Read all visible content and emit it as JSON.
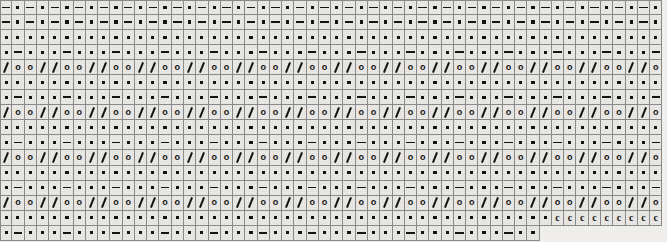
{
  "chart_data": {
    "type": "table",
    "xlabel": "stitch number",
    "ylabel": "row number",
    "grid": true,
    "legend_position": "none",
    "columns": 54,
    "rows": 16,
    "cell_width_px": 12.28,
    "cell_height_px": 15.05,
    "symbol_names": {
      "dash": "purl-stitch-dash",
      "dot": "knit-stitch-dot",
      "slash": "decrease-slash",
      "yo": "yarn-over-circle",
      "c": "cable-stitch-c",
      "blank": "no-stitch-blank"
    },
    "symbol_glyphs": {
      "dash": "—",
      "dot": "•",
      "slash": "/",
      "yo": "o",
      "c": "c",
      "blank": ""
    },
    "colors": {
      "cell_fill": "#eceae6",
      "cell_border": "#8c8c8c",
      "symbol_ink": "#141414",
      "page_background": "#f4f3f0",
      "number_text": "#6a6a6a"
    },
    "row_labels": [
      "16",
      "15",
      "14",
      "13",
      "12",
      "11",
      "10",
      "9",
      "8",
      "7",
      "6",
      "5",
      "4",
      "3",
      "2",
      "1"
    ],
    "column_numbers": [
      "54",
      "53",
      "52",
      "51",
      "50",
      "49",
      "48",
      "47",
      "46",
      "45",
      "44",
      "43",
      "42",
      "41",
      "40",
      "39",
      "38",
      "37",
      "36",
      "35",
      "34",
      "33",
      "32",
      "31",
      "30",
      "29",
      "28",
      "27",
      "26",
      "25",
      "24",
      "23",
      "22",
      "21",
      "20",
      "19",
      "18",
      "17",
      "16",
      "15",
      "14",
      "13",
      "12",
      "11",
      "10",
      "9",
      "8",
      "7",
      "6",
      "5",
      "4",
      "3",
      "2",
      "1"
    ],
    "cells": [
      [
        "dash",
        "dot",
        "dash",
        "dot",
        "dash",
        "dot",
        "dash",
        "dot",
        "dash",
        "dot",
        "dash",
        "dot",
        "dash",
        "dot",
        "dash",
        "dot",
        "dash",
        "dot",
        "dash",
        "dot",
        "dash",
        "dot",
        "dash",
        "dot",
        "dash",
        "dot",
        "dash",
        "dot",
        "dash",
        "dot",
        "dash",
        "dot",
        "dash",
        "dot",
        "dash",
        "dot",
        "dash",
        "dot",
        "dash",
        "dot",
        "dash",
        "dot",
        "dash",
        "dot",
        "dash",
        "dot",
        "dash",
        "dot",
        "dash",
        "dot",
        "dash",
        "dot",
        "dash",
        "dot"
      ],
      [
        "dash",
        "dot",
        "dash",
        "dot",
        "dash",
        "dot",
        "dash",
        "dot",
        "dash",
        "dot",
        "dash",
        "dot",
        "dash",
        "dot",
        "dash",
        "dot",
        "dash",
        "dot",
        "dash",
        "dot",
        "dash",
        "dot",
        "dash",
        "dot",
        "dash",
        "dot",
        "dash",
        "dot",
        "dash",
        "dot",
        "dash",
        "dot",
        "dash",
        "dot",
        "dash",
        "dot",
        "dash",
        "dot",
        "dash",
        "dot",
        "dash",
        "dot",
        "dash",
        "dot",
        "dash",
        "dot",
        "dash",
        "dot",
        "dash",
        "dot",
        "dash",
        "dot",
        "dash",
        "dot"
      ],
      [
        "dot",
        "dot",
        "dot",
        "dot",
        "dot",
        "dot",
        "dot",
        "dot",
        "dot",
        "dot",
        "dot",
        "dot",
        "dot",
        "dot",
        "dot",
        "dot",
        "dot",
        "dot",
        "dot",
        "dot",
        "dot",
        "dot",
        "dot",
        "dot",
        "dot",
        "dot",
        "dot",
        "dot",
        "dot",
        "dot",
        "dot",
        "dot",
        "dot",
        "dot",
        "dot",
        "dot",
        "dot",
        "dot",
        "dot",
        "dot",
        "dot",
        "dot",
        "dot",
        "dot",
        "dot",
        "dot",
        "dot",
        "dot",
        "dot",
        "dot",
        "dot",
        "dot",
        "dot",
        "dot"
      ],
      [
        "dot",
        "dash",
        "dot",
        "dot",
        "dot",
        "dash",
        "dot",
        "dot",
        "dot",
        "dash",
        "dot",
        "dot",
        "dot",
        "dash",
        "dot",
        "dot",
        "dot",
        "dash",
        "dot",
        "dot",
        "dot",
        "dash",
        "dot",
        "dot",
        "dot",
        "dash",
        "dot",
        "dot",
        "dot",
        "dash",
        "dot",
        "dot",
        "dot",
        "dash",
        "dot",
        "dot",
        "dot",
        "dash",
        "dot",
        "dot",
        "dot",
        "dash",
        "dot",
        "dot",
        "dot",
        "dash",
        "dot",
        "dot",
        "dot",
        "dash",
        "dot",
        "dot",
        "dot",
        "dash"
      ],
      [
        "slash",
        "yo",
        "yo",
        "slash",
        "slash",
        "yo",
        "yo",
        "slash",
        "slash",
        "yo",
        "yo",
        "slash",
        "slash",
        "yo",
        "yo",
        "slash",
        "slash",
        "yo",
        "yo",
        "slash",
        "slash",
        "yo",
        "yo",
        "slash",
        "slash",
        "yo",
        "yo",
        "slash",
        "slash",
        "yo",
        "yo",
        "slash",
        "slash",
        "yo",
        "yo",
        "slash",
        "slash",
        "yo",
        "yo",
        "slash",
        "slash",
        "yo",
        "yo",
        "slash",
        "slash",
        "yo",
        "yo",
        "slash",
        "slash",
        "yo",
        "yo",
        "slash",
        "slash",
        "yo"
      ],
      [
        "dot",
        "dot",
        "dot",
        "dot",
        "dot",
        "dot",
        "dot",
        "dot",
        "dot",
        "dot",
        "dot",
        "dot",
        "dot",
        "dot",
        "dot",
        "dot",
        "dot",
        "dot",
        "dot",
        "dot",
        "dot",
        "dot",
        "dot",
        "dot",
        "dot",
        "dot",
        "dot",
        "dot",
        "dot",
        "dot",
        "dot",
        "dot",
        "dot",
        "dot",
        "dot",
        "dot",
        "dot",
        "dot",
        "dot",
        "dot",
        "dot",
        "dot",
        "dot",
        "dot",
        "dot",
        "dot",
        "dot",
        "dot",
        "dot",
        "dot",
        "dot",
        "dot",
        "dot",
        "dot"
      ],
      [
        "dot",
        "dash",
        "dot",
        "dot",
        "dot",
        "dash",
        "dot",
        "dot",
        "dot",
        "dash",
        "dot",
        "dot",
        "dot",
        "dash",
        "dot",
        "dot",
        "dot",
        "dash",
        "dot",
        "dot",
        "dot",
        "dash",
        "dot",
        "dot",
        "dot",
        "dash",
        "dot",
        "dot",
        "dot",
        "dash",
        "dot",
        "dot",
        "dot",
        "dash",
        "dot",
        "dot",
        "dot",
        "dash",
        "dot",
        "dot",
        "dot",
        "dash",
        "dot",
        "dot",
        "dot",
        "dash",
        "dot",
        "dot",
        "dot",
        "dash",
        "dot",
        "dot",
        "dot",
        "dash"
      ],
      [
        "slash",
        "yo",
        "yo",
        "slash",
        "slash",
        "yo",
        "yo",
        "slash",
        "slash",
        "yo",
        "yo",
        "slash",
        "slash",
        "yo",
        "yo",
        "slash",
        "slash",
        "yo",
        "yo",
        "slash",
        "slash",
        "yo",
        "yo",
        "slash",
        "slash",
        "yo",
        "yo",
        "slash",
        "slash",
        "yo",
        "yo",
        "slash",
        "slash",
        "yo",
        "yo",
        "slash",
        "slash",
        "yo",
        "yo",
        "slash",
        "slash",
        "yo",
        "yo",
        "slash",
        "slash",
        "yo",
        "yo",
        "slash",
        "slash",
        "yo",
        "yo",
        "slash",
        "slash",
        "yo"
      ],
      [
        "dot",
        "dot",
        "dot",
        "dot",
        "dot",
        "dot",
        "dot",
        "dot",
        "dot",
        "dot",
        "dot",
        "dot",
        "dot",
        "dot",
        "dot",
        "dot",
        "dot",
        "dot",
        "dot",
        "dot",
        "dot",
        "dot",
        "dot",
        "dot",
        "dot",
        "dot",
        "dot",
        "dot",
        "dot",
        "dot",
        "dot",
        "dot",
        "dot",
        "dot",
        "dot",
        "dot",
        "dot",
        "dot",
        "dot",
        "dot",
        "dot",
        "dot",
        "dot",
        "dot",
        "dot",
        "dot",
        "dot",
        "dot",
        "dot",
        "dot",
        "dot",
        "dot",
        "dot",
        "dot"
      ],
      [
        "dot",
        "dash",
        "dot",
        "dot",
        "dot",
        "dash",
        "dot",
        "dot",
        "dot",
        "dash",
        "dot",
        "dot",
        "dot",
        "dash",
        "dot",
        "dot",
        "dot",
        "dash",
        "dot",
        "dot",
        "dot",
        "dash",
        "dot",
        "dot",
        "dot",
        "dash",
        "dot",
        "dot",
        "dot",
        "dash",
        "dot",
        "dot",
        "dot",
        "dash",
        "dot",
        "dot",
        "dot",
        "dash",
        "dot",
        "dot",
        "dot",
        "dash",
        "dot",
        "dot",
        "dot",
        "dash",
        "dot",
        "dot",
        "dot",
        "dash",
        "dot",
        "dot",
        "dot",
        "dash"
      ],
      [
        "slash",
        "yo",
        "yo",
        "slash",
        "slash",
        "yo",
        "yo",
        "slash",
        "slash",
        "yo",
        "yo",
        "slash",
        "slash",
        "yo",
        "yo",
        "slash",
        "slash",
        "yo",
        "yo",
        "slash",
        "slash",
        "yo",
        "yo",
        "slash",
        "slash",
        "yo",
        "yo",
        "slash",
        "slash",
        "yo",
        "yo",
        "slash",
        "slash",
        "yo",
        "yo",
        "slash",
        "slash",
        "yo",
        "yo",
        "slash",
        "slash",
        "yo",
        "yo",
        "slash",
        "slash",
        "yo",
        "yo",
        "slash",
        "slash",
        "yo",
        "yo",
        "slash",
        "slash",
        "yo"
      ],
      [
        "dot",
        "dot",
        "dot",
        "dot",
        "dot",
        "dot",
        "dot",
        "dot",
        "dot",
        "dot",
        "dot",
        "dot",
        "dot",
        "dot",
        "dot",
        "dot",
        "dot",
        "dot",
        "dot",
        "dot",
        "dot",
        "dot",
        "dot",
        "dot",
        "dot",
        "dot",
        "dot",
        "dot",
        "dot",
        "dot",
        "dot",
        "dot",
        "dot",
        "dot",
        "dot",
        "dot",
        "dot",
        "dot",
        "dot",
        "dot",
        "dot",
        "dot",
        "dot",
        "dot",
        "dot",
        "dot",
        "dot",
        "dot",
        "dot",
        "dot",
        "dot",
        "dot",
        "dot",
        "dot"
      ],
      [
        "dot",
        "dash",
        "dot",
        "dot",
        "dot",
        "dash",
        "dot",
        "dot",
        "dot",
        "dash",
        "dot",
        "dot",
        "dot",
        "dash",
        "dot",
        "dot",
        "dot",
        "dash",
        "dot",
        "dot",
        "dot",
        "dash",
        "dot",
        "dot",
        "dot",
        "dash",
        "dot",
        "dot",
        "dot",
        "dash",
        "dot",
        "dot",
        "dot",
        "dash",
        "dot",
        "dot",
        "dot",
        "dash",
        "dot",
        "dot",
        "dot",
        "dash",
        "dot",
        "dot",
        "dot",
        "dash",
        "dot",
        "dot",
        "dot",
        "dash",
        "dot",
        "dot",
        "dot",
        "dash"
      ],
      [
        "slash",
        "yo",
        "yo",
        "slash",
        "slash",
        "yo",
        "yo",
        "slash",
        "slash",
        "yo",
        "yo",
        "slash",
        "slash",
        "yo",
        "yo",
        "slash",
        "slash",
        "yo",
        "yo",
        "slash",
        "slash",
        "yo",
        "yo",
        "slash",
        "slash",
        "yo",
        "yo",
        "slash",
        "slash",
        "yo",
        "yo",
        "slash",
        "slash",
        "yo",
        "yo",
        "slash",
        "slash",
        "yo",
        "yo",
        "slash",
        "slash",
        "yo",
        "yo",
        "slash",
        "slash",
        "yo",
        "yo",
        "slash",
        "slash",
        "yo",
        "yo",
        "slash",
        "slash",
        "yo"
      ],
      [
        "dot",
        "dot",
        "dot",
        "dot",
        "dot",
        "dot",
        "dot",
        "dot",
        "dot",
        "dot",
        "dot",
        "dot",
        "dot",
        "dot",
        "dot",
        "dot",
        "dot",
        "dot",
        "dot",
        "dot",
        "dot",
        "dot",
        "dot",
        "dot",
        "dot",
        "dot",
        "dot",
        "dot",
        "dot",
        "dot",
        "dot",
        "dot",
        "dot",
        "dot",
        "dot",
        "dot",
        "dot",
        "dot",
        "dot",
        "dot",
        "dot",
        "dot",
        "dot",
        "dot",
        "dot",
        "c",
        "c",
        "c",
        "c",
        "c",
        "c",
        "c",
        "c",
        "c"
      ],
      [
        "dot",
        "dash",
        "dot",
        "dot",
        "dot",
        "dash",
        "dot",
        "dot",
        "dot",
        "dash",
        "dot",
        "dot",
        "dot",
        "dash",
        "dot",
        "dot",
        "dot",
        "dash",
        "dot",
        "dot",
        "dot",
        "dash",
        "dot",
        "dot",
        "dot",
        "dash",
        "dot",
        "dot",
        "dot",
        "dash",
        "dot",
        "dot",
        "dot",
        "dash",
        "dot",
        "dot",
        "dot",
        "dash",
        "dot",
        "dot",
        "dot",
        "dash",
        "dot",
        "dot",
        "blank",
        "blank",
        "blank",
        "blank",
        "blank",
        "blank",
        "blank",
        "blank",
        "blank",
        "blank"
      ]
    ]
  }
}
